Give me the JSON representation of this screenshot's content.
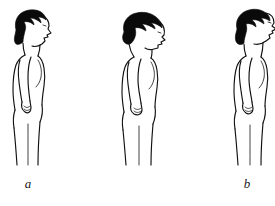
{
  "image": {
    "kind": "line-drawing-illustration",
    "background_color": "#ffffff",
    "ink_color": "#111111",
    "hair_color": "#0a0a0a",
    "subject": "woman standing in side profile",
    "panel_count": 3
  },
  "panels": [
    {
      "id": "a",
      "caption": "a",
      "posture": "neutral-head-upright",
      "description": "side profile standing, head in neutral upright position"
    },
    {
      "id": "b",
      "caption": "b",
      "posture": "neck-flexion-chin-down",
      "description": "side profile standing, head flexed forward with chin toward chest"
    },
    {
      "id": "c",
      "caption": "c",
      "posture": "neck-extension-chin-up",
      "description": "side profile standing, head extended back with chin raised"
    }
  ]
}
